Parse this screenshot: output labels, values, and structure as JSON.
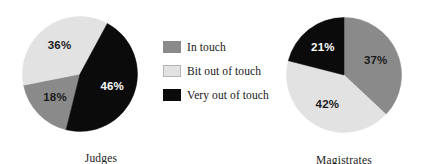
{
  "chart_data": [
    {
      "type": "pie",
      "title": "Judges",
      "categories": [
        "In touch",
        "Bit out of touch",
        "Very out of touch"
      ],
      "values": [
        18,
        36,
        46
      ],
      "value_labels": [
        "18%",
        "36%",
        "46%"
      ],
      "colors": [
        "#8a8a8a",
        "#e2e2e2",
        "#0b0b0b"
      ],
      "label_colors": [
        "#1a1a1a",
        "#1a1a1a",
        "#ffffff"
      ],
      "start_angle_deg": 194,
      "direction": "clockwise",
      "legend": "shared",
      "grid": false
    },
    {
      "type": "pie",
      "title": "Magistrates",
      "categories": [
        "In touch",
        "Bit out of touch",
        "Very out of touch"
      ],
      "values": [
        37,
        42,
        21
      ],
      "value_labels": [
        "37%",
        "42%",
        "21%"
      ],
      "colors": [
        "#8a8a8a",
        "#e2e2e2",
        "#0b0b0b"
      ],
      "label_colors": [
        "#1a1a1a",
        "#1a1a1a",
        "#ffffff"
      ],
      "start_angle_deg": 0,
      "direction": "clockwise",
      "legend": "shared",
      "grid": false
    }
  ],
  "legend": {
    "position": "center",
    "items": [
      {
        "label": "In touch",
        "color": "#8a8a8a"
      },
      {
        "label": "Bit out of touch",
        "color": "#e2e2e2"
      },
      {
        "label": "Very out of touch",
        "color": "#0b0b0b"
      }
    ]
  },
  "pies": {
    "left": {
      "caption": "Judges",
      "slices": [
        {
          "label": "18%",
          "value": 18,
          "category": "In touch"
        },
        {
          "label": "36%",
          "value": 36,
          "category": "Bit out of touch"
        },
        {
          "label": "46%",
          "value": 46,
          "category": "Very out of touch"
        }
      ]
    },
    "right": {
      "caption": "Magistrates",
      "slices": [
        {
          "label": "37%",
          "value": 37,
          "category": "In touch"
        },
        {
          "label": "42%",
          "value": 42,
          "category": "Bit out of touch"
        },
        {
          "label": "21%",
          "value": 21,
          "category": "Very out of touch"
        }
      ]
    }
  }
}
